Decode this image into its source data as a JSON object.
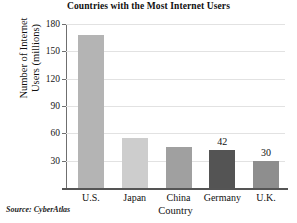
{
  "chart_data": {
    "type": "bar",
    "title": "Countries with the Most Internet Users",
    "xlabel": "Country",
    "ylabel_line1": "Number of Internet",
    "ylabel_line2": "Users (millions)",
    "ylabel": "Number of Internet Users (millions)",
    "categories": [
      "U.S.",
      "Japan",
      "China",
      "Germany",
      "U.K."
    ],
    "values": [
      168,
      55,
      45,
      42,
      30
    ],
    "data_labels": [
      "",
      "",
      "",
      "42",
      "30"
    ],
    "bar_colors": [
      "#b4b4b4",
      "#cdcdcd",
      "#a0a0a0",
      "#545454",
      "#8e8e8e"
    ],
    "ylim": [
      0,
      180
    ],
    "yticks": [
      30,
      60,
      90,
      120,
      150,
      180
    ],
    "ytick_labels": [
      "30",
      "60",
      "90",
      "120",
      "150",
      "180"
    ],
    "grid": true,
    "legend": false,
    "source": "Source: CyberAtlas"
  }
}
